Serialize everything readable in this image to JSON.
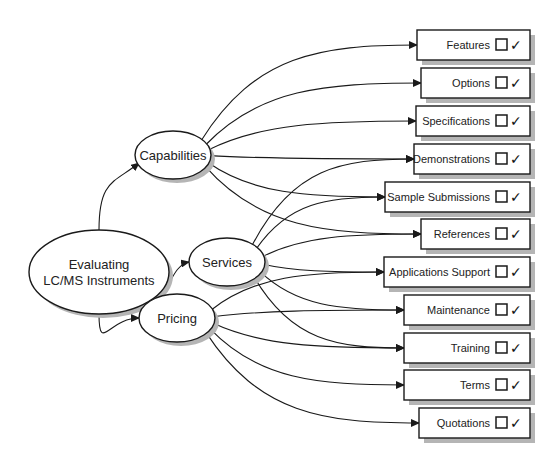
{
  "diagram": {
    "root": {
      "id": "root",
      "lines": [
        "Evaluating",
        "LC/MS Instruments"
      ],
      "cx": 99,
      "cy": 272,
      "rx": 70,
      "ry": 42
    },
    "categories": [
      {
        "id": "capabilities",
        "label": "Capabilities",
        "cx": 173,
        "cy": 155,
        "rx": 38,
        "ry": 24
      },
      {
        "id": "services",
        "label": "Services",
        "cx": 227,
        "cy": 262,
        "rx": 38,
        "ry": 24
      },
      {
        "id": "pricing",
        "label": "Pricing",
        "cx": 177,
        "cy": 318,
        "rx": 38,
        "ry": 24
      }
    ],
    "items": [
      {
        "id": "features",
        "label": "Features",
        "x": 417,
        "y": 30
      },
      {
        "id": "options",
        "label": "Options",
        "x": 421,
        "y": 68
      },
      {
        "id": "specifications",
        "label": "Specifications",
        "x": 416,
        "y": 106
      },
      {
        "id": "demonstrations",
        "label": "Demonstrations",
        "x": 414,
        "y": 144
      },
      {
        "id": "sample-submissions",
        "label": "Sample Submissions",
        "x": 385,
        "y": 182
      },
      {
        "id": "references",
        "label": "References",
        "x": 421,
        "y": 219
      },
      {
        "id": "applications-support",
        "label": "Applications Support",
        "x": 384,
        "y": 257
      },
      {
        "id": "maintenance",
        "label": "Maintenance",
        "x": 404,
        "y": 295
      },
      {
        "id": "training",
        "label": "Training",
        "x": 404,
        "y": 333
      },
      {
        "id": "terms",
        "label": "Terms",
        "x": 404,
        "y": 370
      },
      {
        "id": "quotations",
        "label": "Quotations",
        "x": 419,
        "y": 408
      }
    ],
    "box_right": 530,
    "box_height": 30,
    "checkbox_glyph": "☐",
    "check_glyph": "✓",
    "edges": [
      {
        "from": "root",
        "to": "capabilities"
      },
      {
        "from": "root",
        "to": "services"
      },
      {
        "from": "root",
        "to": "pricing"
      },
      {
        "from": "capabilities",
        "to": "features"
      },
      {
        "from": "capabilities",
        "to": "options"
      },
      {
        "from": "capabilities",
        "to": "specifications"
      },
      {
        "from": "capabilities",
        "to": "demonstrations"
      },
      {
        "from": "capabilities",
        "to": "sample-submissions"
      },
      {
        "from": "capabilities",
        "to": "references"
      },
      {
        "from": "services",
        "to": "demonstrations"
      },
      {
        "from": "services",
        "to": "sample-submissions"
      },
      {
        "from": "services",
        "to": "references"
      },
      {
        "from": "services",
        "to": "applications-support"
      },
      {
        "from": "services",
        "to": "maintenance"
      },
      {
        "from": "services",
        "to": "training"
      },
      {
        "from": "pricing",
        "to": "applications-support"
      },
      {
        "from": "pricing",
        "to": "maintenance"
      },
      {
        "from": "pricing",
        "to": "training"
      },
      {
        "from": "pricing",
        "to": "terms"
      },
      {
        "from": "pricing",
        "to": "quotations"
      }
    ],
    "colors": {
      "stroke": "#1a1a1a",
      "shadow": "#b5b5b5",
      "fill": "#ffffff"
    }
  }
}
